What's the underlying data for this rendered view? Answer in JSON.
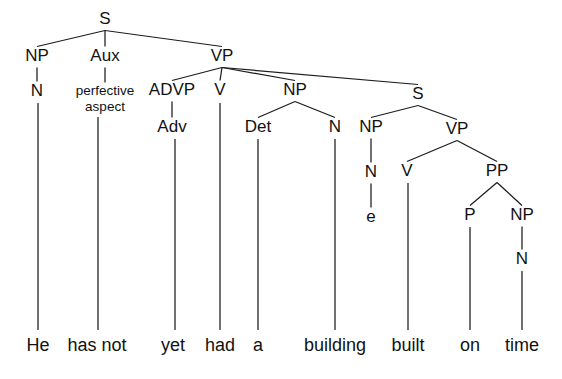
{
  "figure": {
    "kind": "syntax-tree",
    "sentence": "He has not yet had a building built on time",
    "colors": {
      "background": "#ffffff",
      "stroke": "#1c1c1c",
      "text": "#121212"
    },
    "canvas": {
      "width": 562,
      "height": 379
    }
  },
  "nodes": [
    {
      "id": "S",
      "label": "S",
      "x": 105,
      "y": 20,
      "size": "normal"
    },
    {
      "id": "NP1",
      "label": "NP",
      "x": 37,
      "y": 57,
      "size": "normal"
    },
    {
      "id": "Aux",
      "label": "Aux",
      "x": 105,
      "y": 57,
      "size": "normal"
    },
    {
      "id": "VP1",
      "label": "VP",
      "x": 222,
      "y": 57,
      "size": "normal"
    },
    {
      "id": "N1",
      "label": "N",
      "x": 37,
      "y": 92,
      "size": "normal"
    },
    {
      "id": "AuxFeat1",
      "label": "perfective",
      "x": 105,
      "y": 91,
      "size": "small"
    },
    {
      "id": "AuxFeat2",
      "label": "aspect",
      "x": 105,
      "y": 107,
      "size": "small"
    },
    {
      "id": "ADVP",
      "label": "ADVP",
      "x": 172,
      "y": 91,
      "size": "normal"
    },
    {
      "id": "V1",
      "label": "V",
      "x": 220,
      "y": 91,
      "size": "normal"
    },
    {
      "id": "NP2",
      "label": "NP",
      "x": 295,
      "y": 91,
      "size": "normal"
    },
    {
      "id": "S2",
      "label": "S",
      "x": 418,
      "y": 95,
      "size": "normal"
    },
    {
      "id": "Adv",
      "label": "Adv",
      "x": 172,
      "y": 128,
      "size": "normal"
    },
    {
      "id": "Det",
      "label": "Det",
      "x": 258,
      "y": 128,
      "size": "normal"
    },
    {
      "id": "N2",
      "label": "N",
      "x": 335,
      "y": 128,
      "size": "normal"
    },
    {
      "id": "NP3",
      "label": "NP",
      "x": 371,
      "y": 128,
      "size": "normal"
    },
    {
      "id": "VP2",
      "label": "VP",
      "x": 457,
      "y": 130,
      "size": "normal"
    },
    {
      "id": "N3",
      "label": "N",
      "x": 371,
      "y": 173,
      "size": "normal"
    },
    {
      "id": "V2",
      "label": "V",
      "x": 407,
      "y": 172,
      "size": "normal"
    },
    {
      "id": "PP",
      "label": "PP",
      "x": 497,
      "y": 172,
      "size": "normal"
    },
    {
      "id": "Empty",
      "label": "e",
      "x": 371,
      "y": 218,
      "size": "normal"
    },
    {
      "id": "P",
      "label": "P",
      "x": 470,
      "y": 216,
      "size": "normal"
    },
    {
      "id": "NP4",
      "label": "NP",
      "x": 522,
      "y": 216,
      "size": "normal"
    },
    {
      "id": "N4",
      "label": "N",
      "x": 522,
      "y": 260,
      "size": "normal"
    }
  ],
  "edges": [
    {
      "from": "S",
      "to": "NP1",
      "kind": "branch"
    },
    {
      "from": "S",
      "to": "Aux",
      "kind": "branch"
    },
    {
      "from": "S",
      "to": "VP1",
      "kind": "branch"
    },
    {
      "from": "NP1",
      "to": "N1",
      "kind": "stem"
    },
    {
      "from": "Aux",
      "to": "AuxFeat1",
      "kind": "stem"
    },
    {
      "from": "VP1",
      "to": "ADVP",
      "kind": "branch"
    },
    {
      "from": "VP1",
      "to": "V1",
      "kind": "branch"
    },
    {
      "from": "VP1",
      "to": "NP2",
      "kind": "branch"
    },
    {
      "from": "VP1",
      "to": "S2",
      "kind": "branch"
    },
    {
      "from": "ADVP",
      "to": "Adv",
      "kind": "stem"
    },
    {
      "from": "NP2",
      "to": "Det",
      "kind": "branch"
    },
    {
      "from": "NP2",
      "to": "N2",
      "kind": "branch"
    },
    {
      "from": "S2",
      "to": "NP3",
      "kind": "branch"
    },
    {
      "from": "S2",
      "to": "VP2",
      "kind": "branch"
    },
    {
      "from": "NP3",
      "to": "N3",
      "kind": "stem"
    },
    {
      "from": "VP2",
      "to": "V2",
      "kind": "branch"
    },
    {
      "from": "VP2",
      "to": "PP",
      "kind": "branch"
    },
    {
      "from": "N3",
      "to": "Empty",
      "kind": "stem"
    },
    {
      "from": "PP",
      "to": "P",
      "kind": "branch"
    },
    {
      "from": "PP",
      "to": "NP4",
      "kind": "branch"
    },
    {
      "from": "NP4",
      "to": "N4",
      "kind": "stem"
    }
  ],
  "words": [
    {
      "id": "w-he",
      "text": "He",
      "x": 38,
      "lineX": 38,
      "lineTop": 103,
      "parent": "N1"
    },
    {
      "id": "w-has-not",
      "text": "has not",
      "x": 97,
      "lineX": 98,
      "lineTop": 117,
      "parent": "Aux"
    },
    {
      "id": "w-yet",
      "text": "yet",
      "x": 173,
      "lineX": 175,
      "lineTop": 139,
      "parent": "Adv"
    },
    {
      "id": "w-had",
      "text": "had",
      "x": 220,
      "lineX": 220,
      "lineTop": 103,
      "parent": "V1"
    },
    {
      "id": "w-a",
      "text": "a",
      "x": 258,
      "lineX": 258,
      "lineTop": 139,
      "parent": "Det"
    },
    {
      "id": "w-building",
      "text": "building",
      "x": 335,
      "lineX": 335,
      "lineTop": 139,
      "parent": "N2"
    },
    {
      "id": "w-built",
      "text": "built",
      "x": 408,
      "lineX": 408,
      "lineTop": 183,
      "parent": "V2"
    },
    {
      "id": "w-on",
      "text": "on",
      "x": 470,
      "lineX": 470,
      "lineTop": 227,
      "parent": "P"
    },
    {
      "id": "w-time",
      "text": "time",
      "x": 522,
      "lineX": 522,
      "lineTop": 271,
      "parent": "N4"
    }
  ],
  "word_row": {
    "baselineY": 346,
    "lineBottomY": 330
  }
}
